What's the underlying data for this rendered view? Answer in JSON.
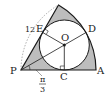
{
  "diagram": {
    "type": "geometry",
    "colors": {
      "stroke": "#1a1a1a",
      "shade": "#bdbdbd",
      "dashed": "#888888",
      "background": "#ffffff"
    },
    "labels": {
      "P": "P",
      "A": "A",
      "C": "C",
      "D": "D",
      "E": "E",
      "O": "O",
      "radius": "12",
      "angle_num": "π",
      "angle_den": "3"
    },
    "points": {
      "P": [
        21,
        70
      ],
      "A": [
        96,
        70
      ],
      "B": [
        58.5,
        5
      ],
      "O": [
        64.3,
        45
      ],
      "C": [
        64.3,
        70
      ],
      "D": [
        86,
        32.5
      ],
      "E": [
        42.7,
        32.5
      ]
    },
    "sector_radius_px": 75,
    "circle_radius_px": 25,
    "central_angle": "π/3"
  }
}
